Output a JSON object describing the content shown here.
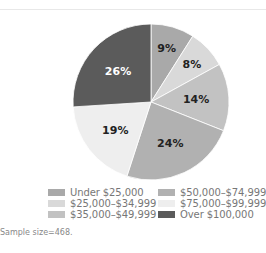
{
  "chart_data": {
    "type": "pie",
    "title": "",
    "start_angle_deg": 0,
    "direction": "clockwise",
    "slices": [
      {
        "label": "Under $25,000",
        "value": 9,
        "display": "9%",
        "color": "#a9a9a9",
        "text_color": "#222222"
      },
      {
        "label": "$25,000–$34,999",
        "value": 8,
        "display": "8%",
        "color": "#d9d9d9",
        "text_color": "#222222"
      },
      {
        "label": "$35,000–$49,999",
        "value": 14,
        "display": "14%",
        "color": "#c2c2c2",
        "text_color": "#222222"
      },
      {
        "label": "$50,000–$74,999",
        "value": 24,
        "display": "24%",
        "color": "#b1b1b1",
        "text_color": "#222222"
      },
      {
        "label": "$75,000–$99,999",
        "value": 19,
        "display": "19%",
        "color": "#eeeeee",
        "text_color": "#222222"
      },
      {
        "label": "Over $100,000",
        "value": 26,
        "display": "26%",
        "color": "#5b5b5b",
        "text_color": "#ffffff"
      }
    ],
    "legend": {
      "position": "bottom",
      "columns": 2,
      "entries": [
        "Under $25,000",
        "$25,000–$34,999",
        "$35,000–$49,999",
        "$50,000–$74,999",
        "$75,000–$99,999",
        "Over $100,000"
      ]
    }
  },
  "legend": {
    "items": [
      {
        "label": "Under $25,000",
        "color": "#a9a9a9"
      },
      {
        "label": "$25,000–$34,999",
        "color": "#d9d9d9"
      },
      {
        "label": "$35,000–$49,999",
        "color": "#c2c2c2"
      },
      {
        "label": "$50,000–$74,999",
        "color": "#b1b1b1"
      },
      {
        "label": "$75,000–$99,999",
        "color": "#eeeeee"
      },
      {
        "label": "Over $100,000",
        "color": "#5b5b5b"
      }
    ]
  },
  "caption": "Sample size=468."
}
